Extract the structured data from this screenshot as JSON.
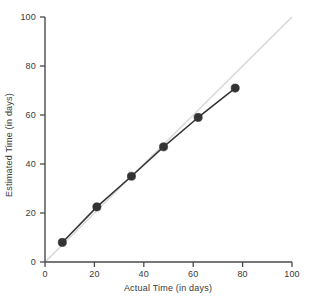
{
  "chart_data": {
    "type": "line",
    "title": "",
    "subtitle": "",
    "xlabel": "Actual Time (in days)",
    "ylabel": "Estimated Time (in days)",
    "xlim": [
      0,
      100
    ],
    "ylim": [
      0,
      100
    ],
    "xticks": [
      0,
      20,
      40,
      60,
      80,
      100
    ],
    "yticks": [
      0,
      20,
      40,
      60,
      80,
      100
    ],
    "xticklabels": [
      "0",
      "20",
      "40",
      "60",
      "80",
      "100"
    ],
    "yticklabels": [
      "0",
      "20",
      "40",
      "60",
      "80",
      "100"
    ],
    "grid": false,
    "legend": null,
    "legend_position": "none",
    "series": [
      {
        "name": "Estimated vs Actual",
        "marker": "filled-circle",
        "color": "#333333",
        "line_color": "#333333",
        "x": [
          7,
          21,
          35,
          48,
          62,
          77
        ],
        "y": [
          8,
          22.5,
          35,
          47,
          59,
          71
        ]
      },
      {
        "name": "Reference line y = x",
        "marker": "none",
        "color": "#d9d9d9",
        "line_color": "#d9d9d9",
        "x": [
          0,
          100
        ],
        "y": [
          0,
          100
        ]
      }
    ]
  },
  "axes": {
    "x_title": "Actual Time (in days)",
    "y_title": "Estimated Time (in days)",
    "axis_color": "#4a4a4a"
  },
  "colors": {
    "data_line": "#333333",
    "data_marker": "#333333",
    "reference_line": "#d9d9d9",
    "axis": "#4a4a4a",
    "text": "#3a3a3a",
    "background": "#ffffff"
  }
}
